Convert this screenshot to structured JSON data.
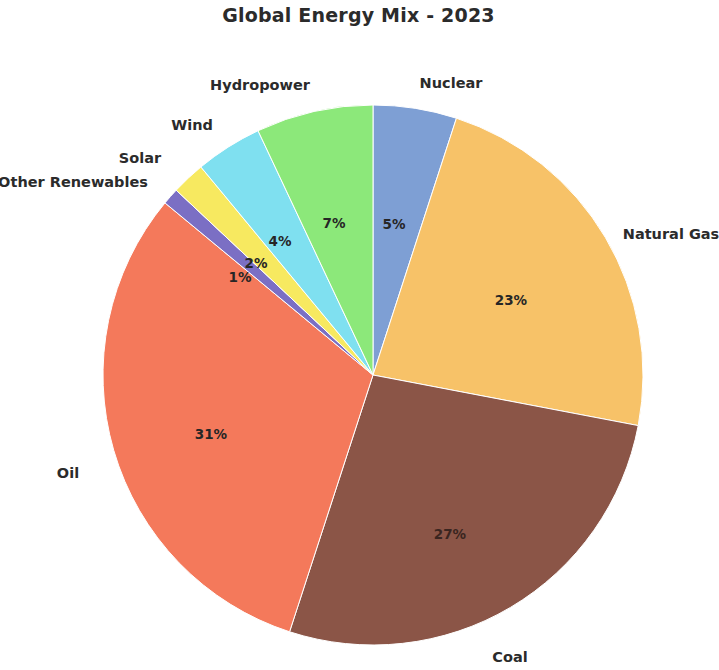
{
  "chart_data": {
    "type": "pie",
    "title": "Global Energy Mix - 2023",
    "xlabel": "",
    "ylabel": "",
    "categories": [
      "Nuclear",
      "Natural Gas",
      "Coal",
      "Oil",
      "Other Renewables",
      "Solar",
      "Wind",
      "Hydropower"
    ],
    "values": [
      5,
      23,
      27,
      31,
      1,
      2,
      4,
      7
    ],
    "value_labels": [
      "5%",
      "23%",
      "27%",
      "31%",
      "1%",
      "2%",
      "4%",
      "7%"
    ],
    "colors": [
      "#7e9fd4",
      "#f7c268",
      "#8b5547",
      "#f4795b",
      "#7b6fc4",
      "#f7e960",
      "#7fe0f0",
      "#8ce87a"
    ],
    "start_angle_deg": 90,
    "direction": "clockwise",
    "legend": "none",
    "grid": false,
    "background": "#ffffff",
    "slices": [
      {
        "label": "Nuclear",
        "value": 5,
        "pct": "5%",
        "color": "#7e9fd4",
        "label_x": 451,
        "label_y": 83,
        "label_anchor": "center",
        "pct_x": 394,
        "pct_y": 224,
        "dark": false
      },
      {
        "label": "Natural Gas",
        "value": 23,
        "pct": "23%",
        "color": "#f7c268",
        "label_x": 671,
        "label_y": 234,
        "label_anchor": "center",
        "pct_x": 511,
        "pct_y": 300,
        "dark": false
      },
      {
        "label": "Coal",
        "value": 27,
        "pct": "27%",
        "color": "#8b5547",
        "label_x": 510,
        "label_y": 657,
        "label_anchor": "center",
        "pct_x": 450,
        "pct_y": 534,
        "dark": true
      },
      {
        "label": "Oil",
        "value": 31,
        "pct": "31%",
        "color": "#f4795b",
        "label_x": 68,
        "label_y": 473,
        "label_anchor": "center",
        "pct_x": 211,
        "pct_y": 434,
        "dark": false
      },
      {
        "label": "Other Renewables",
        "value": 1,
        "pct": "1%",
        "color": "#7b6fc4",
        "label_x": 73,
        "label_y": 182,
        "label_anchor": "center",
        "pct_x": 240,
        "pct_y": 277,
        "dark": false
      },
      {
        "label": "Solar",
        "value": 2,
        "pct": "2%",
        "color": "#f7e960",
        "label_x": 140,
        "label_y": 158,
        "label_anchor": "center",
        "pct_x": 256,
        "pct_y": 263,
        "dark": false
      },
      {
        "label": "Wind",
        "value": 4,
        "pct": "4%",
        "color": "#7fe0f0",
        "label_x": 192,
        "label_y": 125,
        "label_anchor": "center",
        "pct_x": 280,
        "pct_y": 241,
        "dark": false
      },
      {
        "label": "Hydropower",
        "value": 7,
        "pct": "7%",
        "color": "#8ce87a",
        "label_x": 260,
        "label_y": 85,
        "label_anchor": "center",
        "pct_x": 334,
        "pct_y": 223,
        "dark": false
      }
    ],
    "geometry": {
      "center_x": 373,
      "center_y": 375,
      "radius": 270
    }
  }
}
